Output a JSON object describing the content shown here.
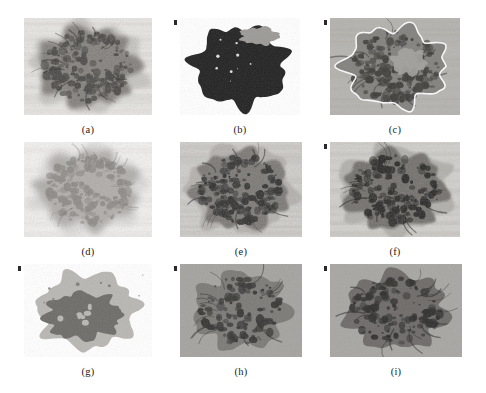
{
  "figure": {
    "background_color": "#ffffff",
    "rows": 3,
    "columns": 3,
    "panels": [
      {
        "id": "a",
        "caption": "(a)",
        "description": "original grayscale mammogram region of interest showing dense spiculated mass texture",
        "kind": "grayscale-photo",
        "x": 24,
        "y": 18,
        "width": 128,
        "height": 97,
        "background_color": "#e8e6e3",
        "tissue_color": "#6f6c68",
        "core_color": "#2e2c2a",
        "contrast": "low",
        "corner_tick": false
      },
      {
        "id": "b",
        "caption": "(b)",
        "description": "binary segmentation mask of the mass, dark blob on white background",
        "kind": "binary-mask",
        "x": 180,
        "y": 18,
        "width": 120,
        "height": 97,
        "background_color": "#ffffff",
        "tissue_color": "#9c9a97",
        "core_color": "#232220",
        "contrast": "high",
        "corner_tick": true
      },
      {
        "id": "c",
        "caption": "(c)",
        "description": "segmentation contour overlaid in white on the grayscale region, two-level interior",
        "kind": "contour-overlay",
        "x": 330,
        "y": 18,
        "width": 130,
        "height": 97,
        "background_color": "#b6b4b0",
        "tissue_color": "#7a7875",
        "core_color": "#3a3936",
        "contour_color": "#ffffff",
        "contrast": "medium",
        "corner_tick": true
      },
      {
        "id": "d",
        "caption": "(d)",
        "description": "smoothed / low-contrast enhanced version of the original region",
        "kind": "grayscale-photo",
        "x": 24,
        "y": 142,
        "width": 128,
        "height": 95,
        "background_color": "#f3f2f0",
        "tissue_color": "#a3a09c",
        "core_color": "#5a5754",
        "contrast": "very-low",
        "corner_tick": false
      },
      {
        "id": "e",
        "caption": "(e)",
        "description": "contrast enhanced grayscale region with visible textured background",
        "kind": "grayscale-photo",
        "x": 180,
        "y": 142,
        "width": 122,
        "height": 95,
        "background_color": "#cfcdc9",
        "tissue_color": "#6a6764",
        "core_color": "#282725",
        "contrast": "medium",
        "corner_tick": false
      },
      {
        "id": "f",
        "caption": "(f)",
        "description": "high contrast grayscale region emphasising spiculations",
        "kind": "grayscale-photo",
        "x": 330,
        "y": 142,
        "width": 130,
        "height": 95,
        "background_color": "#d2d0cc",
        "tissue_color": "#5d5b58",
        "core_color": "#1f1e1c",
        "contrast": "high",
        "corner_tick": true
      },
      {
        "id": "g",
        "caption": "(g)",
        "description": "two-level region map, light grey surround with solid dark grey segmented core",
        "kind": "region-map",
        "x": 24,
        "y": 264,
        "width": 128,
        "height": 93,
        "background_color": "#ffffff",
        "tissue_color": "#b9b7b3",
        "core_color": "#6e6c69",
        "contrast": "flat",
        "corner_tick": true
      },
      {
        "id": "h",
        "caption": "(h)",
        "description": "quantised segmentation of the mass on mid grey background",
        "kind": "region-map",
        "x": 180,
        "y": 264,
        "width": 122,
        "height": 93,
        "background_color": "#a5a3a0",
        "tissue_color": "#7c7a77",
        "core_color": "#333230",
        "contrast": "medium",
        "corner_tick": true
      },
      {
        "id": "i",
        "caption": "(i)",
        "description": "final quantised segmentation with speckled dark core on grey background",
        "kind": "region-map",
        "x": 330,
        "y": 264,
        "width": 132,
        "height": 93,
        "background_color": "#a8a6a3",
        "tissue_color": "#6d6b68",
        "core_color": "#2b2a28",
        "contrast": "medium",
        "corner_tick": true
      }
    ],
    "caption_offset_y": 9
  }
}
